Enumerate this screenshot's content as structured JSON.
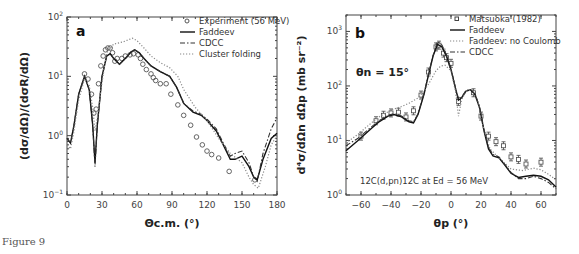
{
  "caption": "Figure 9",
  "chart_data": [
    {
      "type": "line",
      "panel_label": "a",
      "title": "",
      "xlabel": "Θc.m. (°)",
      "ylabel": "(dσ/dΩ)/(dσR/dΩ)",
      "xlim": [
        0,
        180
      ],
      "ylim": [
        0.1,
        100
      ],
      "yscale": "log",
      "xticks": [
        "0",
        "30",
        "60",
        "90",
        "120",
        "150",
        "180"
      ],
      "yticks": [
        "10^-1",
        "10^0",
        "10^1",
        "10^2"
      ],
      "legend_position": "upper right",
      "legend": [
        "Experiment (56 MeV)",
        "Faddeev",
        "CDCC",
        "Cluster folding"
      ],
      "series": [
        {
          "name": "Experiment (56 MeV)",
          "style": "circles",
          "x": [
            15,
            18,
            21,
            23,
            25,
            27,
            29,
            31,
            33,
            35,
            37,
            39,
            41,
            43,
            47,
            50,
            54,
            57,
            61,
            63,
            65,
            68,
            72,
            74,
            76,
            80,
            85,
            89,
            95,
            100,
            106,
            111,
            116,
            120,
            124,
            130,
            139,
            161
          ],
          "y": [
            11,
            9,
            5,
            2.4,
            2.8,
            7.5,
            15,
            22,
            28,
            30,
            30,
            25,
            18,
            20,
            20,
            22,
            23,
            24,
            23,
            20,
            16,
            13,
            11,
            9.5,
            8.5,
            7.5,
            7.5,
            5,
            3.3,
            2.2,
            1.5,
            0.95,
            0.7,
            0.55,
            0.48,
            0.42,
            0.25,
            0.18
          ]
        },
        {
          "name": "Faddeev",
          "style": "solid",
          "x": [
            0,
            3,
            6,
            10,
            15,
            19,
            22,
            24,
            26,
            30,
            34,
            37,
            40,
            45,
            50,
            55,
            58,
            62,
            66,
            72,
            80,
            88,
            94,
            100,
            108,
            115,
            120,
            128,
            134,
            140,
            144,
            150,
            156,
            160,
            163,
            168,
            175,
            180
          ],
          "y": [
            0.9,
            0.75,
            1.5,
            5,
            10,
            6,
            1.5,
            0.35,
            1.5,
            10,
            22,
            24,
            20,
            16,
            20,
            26,
            28,
            25,
            20,
            15,
            12,
            10,
            6.5,
            3.5,
            2.5,
            2.2,
            1.8,
            1.2,
            0.7,
            0.4,
            0.4,
            0.45,
            0.3,
            0.2,
            0.18,
            0.4,
            0.9,
            1.1
          ]
        },
        {
          "name": "CDCC",
          "style": "dash-dot",
          "x": [
            0,
            3,
            6,
            10,
            15,
            19,
            22,
            24,
            26,
            30,
            34,
            37,
            40,
            45,
            50,
            55,
            58,
            62,
            66,
            72,
            80,
            88,
            94,
            100,
            108,
            115,
            120,
            128,
            134,
            140,
            144,
            150,
            156,
            160,
            163,
            168,
            175,
            180
          ],
          "y": [
            0.9,
            0.75,
            1.5,
            5,
            10,
            6,
            1.5,
            0.3,
            1.5,
            10,
            22,
            24,
            20,
            16,
            20,
            26,
            28,
            25,
            20,
            15,
            12,
            10,
            6.5,
            3.5,
            2.6,
            2.3,
            1.9,
            1.3,
            0.75,
            0.45,
            0.5,
            0.55,
            0.35,
            0.2,
            0.17,
            0.5,
            1.3,
            2.0
          ]
        },
        {
          "name": "Cluster folding",
          "style": "dotted",
          "x": [
            0,
            3,
            6,
            10,
            15,
            19,
            22,
            24,
            26,
            30,
            34,
            40,
            48,
            56,
            60,
            66,
            72,
            80,
            88,
            95,
            100,
            110,
            120,
            130,
            140,
            150,
            156,
            160,
            164,
            170,
            175,
            180
          ],
          "y": [
            0.7,
            0.6,
            1.2,
            4,
            9,
            7,
            3,
            1.2,
            2,
            8,
            25,
            35,
            38,
            44,
            40,
            30,
            22,
            17,
            14,
            10,
            6,
            3,
            1.8,
            0.9,
            0.5,
            0.35,
            0.2,
            0.15,
            0.13,
            0.3,
            0.7,
            1.0
          ]
        }
      ]
    },
    {
      "type": "line",
      "panel_label": "b",
      "title": "",
      "annotation_top": "θn = 15°",
      "annotation_bottom": "12C(d,pn)12C at Ed = 56 MeV",
      "xlabel": "θp (°)",
      "ylabel": "d⁴σ/dΩn dΩp (mb sr⁻²)",
      "xlim": [
        -70,
        70
      ],
      "ylim": [
        1,
        2000
      ],
      "yscale": "log",
      "xticks": [
        "−60",
        "−40",
        "−20",
        "0",
        "20",
        "40",
        "60"
      ],
      "yticks": [
        "10^0",
        "10^1",
        "10^2",
        "10^3"
      ],
      "legend_position": "upper right",
      "legend": [
        "Matsuoka (1982)",
        "Faddeev",
        "Faddeev: no Coulomb",
        "CDCC"
      ],
      "series": [
        {
          "name": "Matsuoka (1982)",
          "style": "squares-errorbars",
          "x": [
            -60,
            -50,
            -45,
            -40,
            -35,
            -30,
            -25,
            -20,
            -15,
            -10,
            -8,
            -5,
            -3,
            0,
            5,
            15,
            20,
            25,
            30,
            35,
            40,
            45,
            50,
            60
          ],
          "y": [
            12,
            23,
            29,
            32,
            33,
            27,
            35,
            68,
            180,
            520,
            560,
            400,
            330,
            260,
            52,
            75,
            28,
            12,
            9.5,
            8,
            5,
            4.5,
            3.7,
            4
          ]
        },
        {
          "name": "Faddeev",
          "style": "solid",
          "x": [
            -70,
            -62,
            -55,
            -48,
            -42,
            -38,
            -33,
            -28,
            -25,
            -22,
            -18,
            -15,
            -12,
            -9,
            -6,
            -3,
            0,
            3,
            5,
            7,
            10,
            13,
            16,
            19,
            22,
            25,
            28,
            32,
            36,
            40,
            45,
            50,
            55,
            60,
            65,
            70
          ],
          "y": [
            6.5,
            10,
            15,
            22,
            28,
            30,
            27,
            22,
            21,
            30,
            70,
            160,
            350,
            580,
            520,
            350,
            200,
            90,
            55,
            60,
            80,
            85,
            70,
            40,
            15,
            7,
            5.2,
            4.8,
            3.5,
            2.5,
            2.1,
            2.2,
            2.3,
            2.2,
            1.9,
            1.4
          ]
        },
        {
          "name": "Faddeev: no Coulomb",
          "style": "dotted",
          "x": [
            -70,
            -62,
            -55,
            -48,
            -40,
            -33,
            -28,
            -22,
            -18,
            -14,
            -10,
            -7,
            -4,
            0,
            3,
            5,
            7,
            10,
            14,
            18,
            22,
            26,
            32,
            40,
            48,
            55,
            60,
            65,
            70
          ],
          "y": [
            9,
            13,
            19,
            27,
            36,
            42,
            48,
            60,
            80,
            120,
            190,
            230,
            240,
            190,
            80,
            28,
            55,
            80,
            85,
            50,
            16,
            7,
            4.8,
            3,
            2.8,
            3.1,
            2.9,
            2.4,
            1.9
          ]
        },
        {
          "name": "CDCC",
          "style": "dash-dot",
          "x": [
            -70,
            -62,
            -55,
            -48,
            -42,
            -38,
            -33,
            -28,
            -25,
            -22,
            -18,
            -15,
            -12,
            -9,
            -6,
            -3,
            0,
            3,
            5,
            7,
            10,
            13,
            16,
            19,
            22,
            25,
            28,
            32,
            36,
            40,
            45,
            50,
            55,
            60,
            65,
            70
          ],
          "y": [
            8,
            11,
            16,
            23,
            29,
            31,
            28,
            23,
            22,
            31,
            72,
            165,
            360,
            650,
            560,
            360,
            205,
            92,
            58,
            62,
            82,
            86,
            72,
            42,
            16,
            7.5,
            5.5,
            5,
            3.6,
            2.6,
            2.0,
            2.0,
            2.2,
            2.0,
            1.7,
            1.3
          ]
        }
      ]
    }
  ]
}
